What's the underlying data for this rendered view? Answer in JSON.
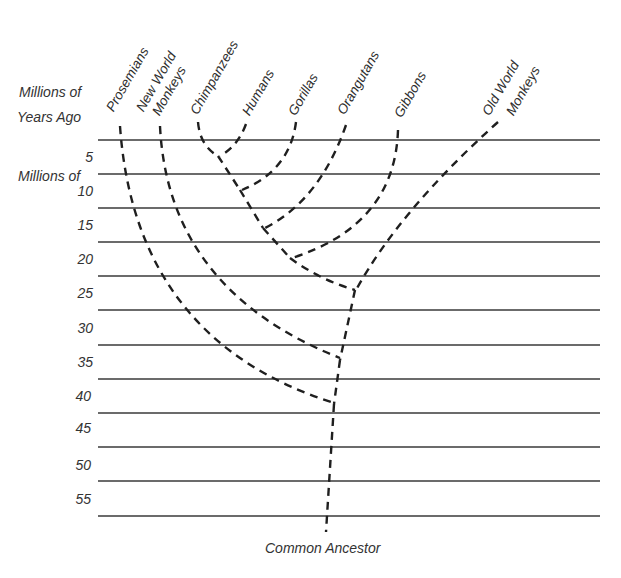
{
  "diagram": {
    "type": "phylogenetic-tree",
    "axis_title_line1": "Millions of",
    "axis_title_line2": "Years  Ago",
    "root_label": "Common Ancestor",
    "line_color": "#3a3a3a",
    "branch_color": "#1f1f1f",
    "time_ticks": [
      "5",
      "10",
      "15",
      "20",
      "25",
      "30",
      "35",
      "40",
      "45",
      "50",
      "55"
    ],
    "taxa": [
      {
        "name": "Prosemians",
        "line2": ""
      },
      {
        "name": "New World",
        "line2": "Monkeys"
      },
      {
        "name": "Chimpanzees",
        "line2": ""
      },
      {
        "name": "Humans",
        "line2": ""
      },
      {
        "name": "Gorillas",
        "line2": ""
      },
      {
        "name": "Orangutans",
        "line2": ""
      },
      {
        "name": "Gibbons",
        "line2": ""
      },
      {
        "name": "Old World",
        "line2": "Monkeys"
      }
    ],
    "divergences_mya": [
      {
        "between": [
          "Chimpanzees",
          "Humans"
        ],
        "mya": 5
      },
      {
        "between": [
          "Chimp/Human",
          "Gorillas"
        ],
        "mya": 10
      },
      {
        "between": [
          "African apes",
          "Orangutans"
        ],
        "mya": 15
      },
      {
        "between": [
          "Great apes",
          "Gibbons"
        ],
        "mya": 20
      },
      {
        "between": [
          "Apes",
          "Old World Monkeys"
        ],
        "mya": 25
      },
      {
        "between": [
          "Catarrhines",
          "New World Monkeys"
        ],
        "mya": 35
      },
      {
        "between": [
          "Anthropoids",
          "Prosemians"
        ],
        "mya": 40
      }
    ]
  }
}
